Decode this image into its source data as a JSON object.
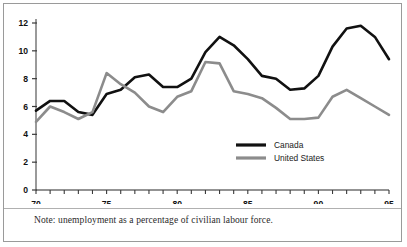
{
  "figure": {
    "note": "Note: unemployment as a percentage of civilian labour force.",
    "frame_color": "#9a9a9a",
    "background": "#ffffff"
  },
  "chart_data": {
    "type": "line",
    "title": "",
    "subtitle": "",
    "xlabel": "",
    "ylabel": "",
    "note": "Note: unemployment as a percentage of civilian labour force.",
    "xlim": [
      70,
      95
    ],
    "ylim": [
      0,
      12
    ],
    "yticks": [
      0,
      2,
      4,
      6,
      8,
      10,
      12
    ],
    "ytick_labels": [
      "0",
      "2",
      "4",
      "6",
      "8",
      "10",
      "12"
    ],
    "xticks": [
      70,
      71,
      72,
      73,
      74,
      75,
      76,
      77,
      78,
      79,
      80,
      81,
      82,
      83,
      84,
      85,
      86,
      87,
      88,
      89,
      90,
      91,
      92,
      93,
      94,
      95
    ],
    "xtick_labels_shown": [
      "70",
      "75",
      "80",
      "85",
      "90",
      "95"
    ],
    "xtick_labels_shown_values": [
      70,
      75,
      80,
      85,
      90,
      95
    ],
    "grid": false,
    "legend_position": "center-right-inside",
    "x": [
      70,
      71,
      72,
      73,
      74,
      75,
      76,
      77,
      78,
      79,
      80,
      81,
      82,
      83,
      84,
      85,
      86,
      87,
      88,
      89,
      90,
      91,
      92,
      93,
      94,
      95
    ],
    "series": [
      {
        "name": "Canada",
        "color": "#111111",
        "line_width": 2.6,
        "values": [
          5.7,
          6.4,
          6.4,
          5.6,
          5.4,
          6.9,
          7.2,
          8.1,
          8.3,
          7.5,
          7.4,
          7.6,
          11.0,
          11.9,
          11.3,
          10.5,
          9.6,
          8.8,
          7.8,
          7.5,
          8.1,
          10.3,
          11.3,
          11.2,
          10.4,
          9.5
        ],
        "values_read_from_pixels": [
          5.7,
          6.4,
          6.4,
          5.6,
          5.4,
          6.9,
          7.2,
          8.1,
          8.3,
          7.4,
          7.4,
          8.0,
          9.9,
          11.0,
          10.4,
          9.4,
          8.2,
          8.0,
          7.2,
          7.3,
          8.2,
          10.3,
          11.6,
          11.8,
          11.0,
          9.4
        ]
      },
      {
        "name": "United States",
        "color": "#8c8c8c",
        "line_width": 2.6,
        "values": [
          4.9,
          6.0,
          5.6,
          5.1,
          5.6,
          8.4,
          7.6,
          7.0,
          6.0,
          5.6,
          6.7,
          7.1,
          9.2,
          9.1,
          7.1,
          6.9,
          6.6,
          5.9,
          5.1,
          5.1,
          5.2,
          6.7,
          7.2,
          6.6,
          6.0,
          5.4
        ],
        "values_read_from_pixels": [
          4.9,
          6.0,
          5.6,
          5.1,
          5.6,
          8.4,
          7.6,
          7.0,
          6.0,
          5.6,
          6.7,
          7.1,
          9.2,
          9.1,
          7.1,
          6.9,
          6.6,
          5.9,
          5.1,
          5.1,
          5.2,
          6.7,
          7.2,
          6.6,
          6.0,
          5.4
        ]
      }
    ],
    "legend": [
      {
        "label": "Canada",
        "color": "#111111"
      },
      {
        "label": "United States",
        "color": "#8c8c8c"
      }
    ]
  }
}
